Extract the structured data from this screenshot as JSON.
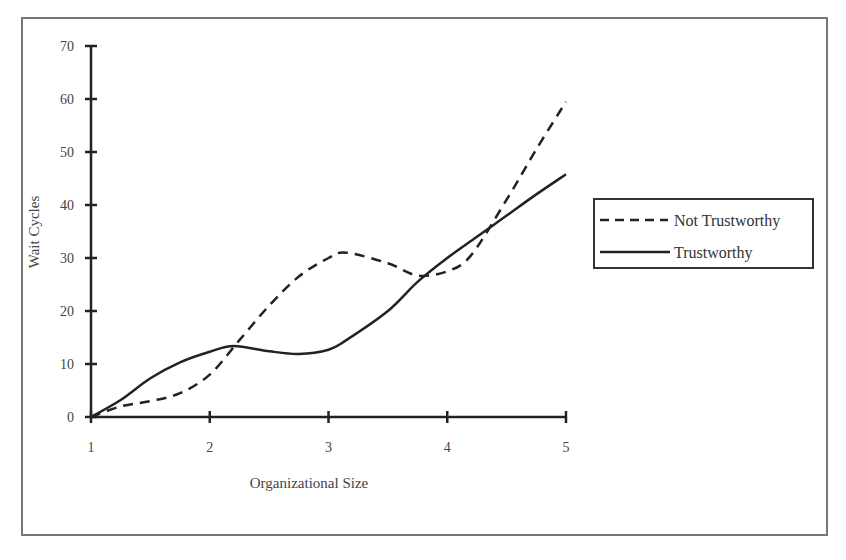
{
  "chart_data": {
    "type": "line",
    "title": "",
    "xlabel": "Organizational Size",
    "ylabel": "Wait Cycles",
    "xlim": [
      1,
      5
    ],
    "ylim": [
      0,
      70
    ],
    "xticks": [
      1,
      2,
      3,
      4,
      5
    ],
    "yticks": [
      0,
      10,
      20,
      30,
      40,
      50,
      60,
      70
    ],
    "grid": false,
    "legend_position": "right",
    "series": [
      {
        "name": "Not Trustworthy",
        "style": "dashed",
        "x": [
          1.0,
          1.25,
          1.5,
          1.75,
          2.0,
          2.25,
          2.5,
          2.75,
          3.0,
          3.15,
          3.5,
          3.75,
          4.0,
          4.2,
          4.5,
          4.75,
          5.0
        ],
        "y": [
          0,
          2,
          3,
          4.5,
          8,
          14.5,
          21,
          26.5,
          30,
          31,
          29,
          26.7,
          27.5,
          30.5,
          41,
          50.5,
          59.5
        ]
      },
      {
        "name": "Trustworthy",
        "style": "solid",
        "x": [
          1.0,
          1.25,
          1.5,
          1.75,
          2.0,
          2.2,
          2.5,
          2.75,
          3.0,
          3.15,
          3.5,
          3.75,
          4.0,
          4.25,
          4.5,
          4.75,
          5.0
        ],
        "y": [
          0,
          3.2,
          7.3,
          10.3,
          12.3,
          13.4,
          12.4,
          11.9,
          12.7,
          14.5,
          20,
          25.5,
          30,
          34,
          38,
          42,
          45.8
        ]
      }
    ]
  }
}
